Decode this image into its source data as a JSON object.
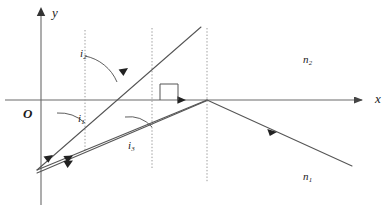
{
  "figure": {
    "axes": {
      "y_label": "y",
      "x_label": "x",
      "origin_label": "O",
      "x_axis_y": 100,
      "y_axis_x": 41,
      "x_axis_start": 5,
      "x_axis_end": 368,
      "y_axis_top": 8,
      "y_axis_bottom": 205
    },
    "media": {
      "upper_label": "n",
      "upper_sub": "2",
      "lower_label": "n",
      "lower_sub": "1"
    },
    "angles": [
      {
        "name": "i",
        "sub": "2",
        "x": 80,
        "y": 48
      },
      {
        "name": "i",
        "sub": "1",
        "x": 78,
        "y": 113
      },
      {
        "name": "i",
        "sub": "3",
        "x": 128,
        "y": 140
      }
    ],
    "normals": [
      {
        "x": 85,
        "y1": 30,
        "y2": 152
      },
      {
        "x": 152,
        "y1": 28,
        "y2": 168
      },
      {
        "x": 207,
        "y1": 28,
        "y2": 180
      }
    ],
    "source_point": {
      "x": 37,
      "y": 170
    },
    "rays": [
      {
        "name": "incident-ray-1",
        "x1": 37,
        "y1": 170,
        "x2": 200,
        "y2": 28
      },
      {
        "name": "incident-ray-2",
        "x1": 37,
        "y1": 170,
        "x2": 207,
        "y2": 100
      },
      {
        "name": "incident-ray-3",
        "x1": 37,
        "y1": 170,
        "x2": 207,
        "y2": 101
      },
      {
        "name": "refracted-ray",
        "x1": 207,
        "y1": 100,
        "x2": 352,
        "y2": 165
      }
    ],
    "colors": {
      "line": "#555555",
      "axis": "#6a6a6a",
      "text": "#1a1a1a",
      "dotted": "#9a9a9a",
      "background": "#ffffff"
    }
  }
}
